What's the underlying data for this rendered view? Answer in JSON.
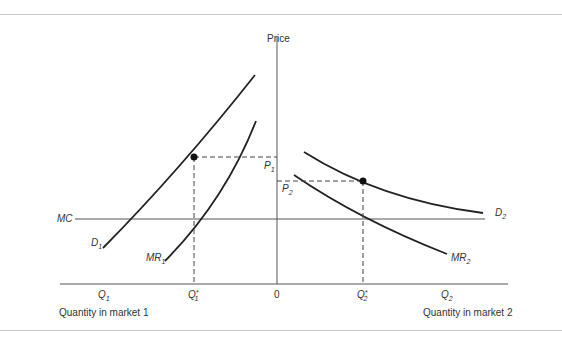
{
  "diagram": {
    "axis_label_price": "Price",
    "origin_label": "0",
    "market1_axis_label": "Quantity in market 1",
    "market2_axis_label": "Quantity in market 2",
    "mc_label": "MC",
    "market1": {
      "demand_label": "D",
      "demand_sub": "1",
      "mr_label": "MR",
      "mr_sub": "1",
      "price_label": "P",
      "price_sub": "1",
      "q_label": "Q",
      "q_sub": "1",
      "qstar_label": "Q",
      "qstar_sub": "1",
      "qstar_sup": "*"
    },
    "market2": {
      "demand_label": "D",
      "demand_sub": "2",
      "mr_label": "MR",
      "mr_sub": "2",
      "price_label": "P",
      "price_sub": "2",
      "q_label": "Q",
      "q_sub": "2",
      "qstar_label": "Q",
      "qstar_sub": "2",
      "qstar_sup": "*"
    }
  }
}
